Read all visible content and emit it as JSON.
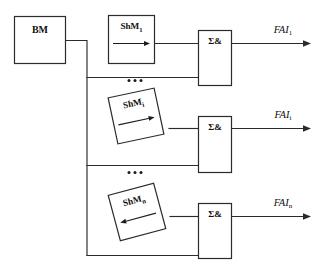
{
  "diagram": {
    "type": "block-diagram",
    "title": "",
    "background_color": "#ffffff",
    "line_color": "#2b2b2b",
    "text_color": "#101010",
    "source_block": {
      "label": "BM",
      "shape": "rectangle"
    },
    "channels": [
      {
        "index": 1,
        "processor_label_base": "ShM",
        "processor_label_sub": "1",
        "processor_rotation_deg": 0,
        "inner_arrow_direction": "right",
        "combiner_label": "Σ&",
        "output_label_base": "FAI",
        "output_label_sub": "1"
      },
      {
        "index": 2,
        "processor_label_base": "ShM",
        "processor_label_sub": "i",
        "processor_rotation_deg": -12,
        "inner_arrow_direction": "right",
        "combiner_label": "Σ&",
        "output_label_base": "FAI",
        "output_label_sub": "i"
      },
      {
        "index": 3,
        "processor_label_base": "ShM",
        "processor_label_sub": "n",
        "processor_rotation_deg": -15,
        "inner_arrow_direction": "left",
        "combiner_label": "Σ&",
        "output_label_base": "FAI",
        "output_label_sub": "n"
      }
    ],
    "ellipsis_markers": [
      {
        "id": "ellipsis-upper",
        "glyph": "•••",
        "dots": 3
      },
      {
        "id": "ellipsis-lower",
        "glyph": "•••",
        "dots": 3
      }
    ]
  }
}
